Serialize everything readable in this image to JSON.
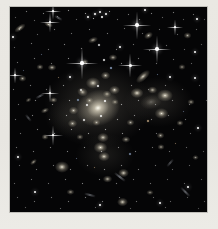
{
  "meta": {
    "description": "Deep-space telescope photograph of a dense galaxy cluster: dozens of fuzzy yellow-white elliptical galaxies concentrated around a large bright central galaxy, foreground stars with cross-shaped diffraction spikes, and many faint points and lensed streaks on a black sky, framed by a pale warm-gray border."
  },
  "frame": {
    "background": "#e9e7e2",
    "photo": {
      "left": 10,
      "top": 7,
      "width": 197,
      "height": 205,
      "background": "#050506"
    }
  },
  "palette": {
    "glow": "185,178,160",
    "galaxy_core": "255,253,242",
    "galaxy_inner": "232,224,202",
    "galaxy_halo": "182,174,154",
    "star": "#ffffff",
    "dot_colors": [
      "255,255,255",
      "168,194,232",
      "255,216,168"
    ],
    "streak": "200,205,215"
  },
  "glows": [
    [
      88,
      98,
      150,
      118,
      0.22
    ],
    [
      148,
      95,
      95,
      70,
      0.15
    ],
    [
      95,
      148,
      82,
      60,
      0.12
    ],
    [
      60,
      110,
      70,
      55,
      0.1
    ]
  ],
  "galaxies": [
    [
      88,
      101,
      62,
      50,
      -18,
      1.0
    ],
    [
      83,
      76,
      20,
      16,
      0,
      0.9
    ],
    [
      72,
      85,
      15,
      12,
      20,
      0.8
    ],
    [
      95,
      68,
      13,
      11,
      0,
      0.8
    ],
    [
      104,
      83,
      15,
      12,
      0,
      0.85
    ],
    [
      63,
      103,
      13,
      11,
      0,
      0.8
    ],
    [
      62,
      116,
      13,
      11,
      0,
      0.75
    ],
    [
      93,
      130,
      16,
      13,
      0,
      0.85
    ],
    [
      127,
      86,
      18,
      14,
      0,
      0.95
    ],
    [
      142,
      83,
      13,
      10,
      0,
      0.8
    ],
    [
      133,
      69,
      24,
      11,
      -42,
      0.9
    ],
    [
      155,
      88,
      22,
      17,
      0,
      0.95
    ],
    [
      151,
      106,
      19,
      15,
      0,
      0.9
    ],
    [
      141,
      95,
      30,
      20,
      -10,
      0.35
    ],
    [
      90,
      140,
      19,
      15,
      0,
      0.95
    ],
    [
      94,
      149,
      16,
      13,
      0,
      0.9
    ],
    [
      113,
      166,
      15,
      12,
      0,
      0.9
    ],
    [
      97,
      172,
      13,
      10,
      0,
      0.8
    ],
    [
      112,
      195,
      15,
      12,
      0,
      0.9
    ],
    [
      52,
      160,
      20,
      16,
      0,
      0.95
    ],
    [
      10,
      21,
      18,
      8,
      -35,
      0.85
    ],
    [
      38,
      17,
      13,
      7,
      25,
      0.8
    ],
    [
      138,
      28,
      13,
      9,
      -30,
      0.8
    ],
    [
      177,
      28,
      11,
      9,
      0,
      0.7
    ],
    [
      23,
      155,
      11,
      6,
      -40,
      0.75
    ],
    [
      150,
      128,
      11,
      9,
      0,
      0.7
    ],
    [
      181,
      95,
      10,
      8,
      0,
      0.7
    ],
    [
      30,
      60,
      10,
      8,
      0,
      0.7
    ],
    [
      42,
      60,
      12,
      9,
      0,
      0.8
    ],
    [
      103,
      50,
      12,
      9,
      0,
      0.75
    ],
    [
      43,
      93,
      11,
      8,
      0,
      0.75
    ],
    [
      12,
      71,
      11,
      9,
      0,
      0.7
    ],
    [
      172,
      60,
      10,
      8,
      0,
      0.65
    ],
    [
      60,
      185,
      11,
      8,
      0,
      0.7
    ],
    [
      140,
      185,
      10,
      7,
      0,
      0.65
    ],
    [
      35,
      130,
      10,
      8,
      0,
      0.7
    ],
    [
      185,
      150,
      9,
      7,
      0,
      0.6
    ],
    [
      120,
      115,
      11,
      9,
      0,
      0.7
    ],
    [
      75,
      55,
      10,
      8,
      0,
      0.7
    ],
    [
      83,
      33,
      14,
      8,
      -20,
      0.75
    ],
    [
      35,
      103,
      12,
      7,
      -25,
      0.7
    ],
    [
      18,
      93,
      9,
      6,
      -30,
      0.6
    ],
    [
      116,
      132,
      12,
      9,
      0,
      0.7
    ],
    [
      151,
      140,
      10,
      8,
      0,
      0.7
    ],
    [
      170,
      116,
      10,
      8,
      0,
      0.7
    ],
    [
      97,
      87,
      12,
      10,
      0,
      0.75
    ],
    [
      79,
      93,
      11,
      9,
      0,
      0.7
    ],
    [
      105,
      95,
      10,
      8,
      0,
      0.7
    ],
    [
      86,
      115,
      11,
      9,
      0,
      0.7
    ],
    [
      70,
      130,
      10,
      8,
      0,
      0.65
    ]
  ],
  "stars": [
    [
      72,
      56,
      1.6,
      16
    ],
    [
      120,
      58,
      1.5,
      12
    ],
    [
      40,
      15,
      1.4,
      10
    ],
    [
      127,
      18,
      1.8,
      14
    ],
    [
      147,
      42,
      1.8,
      14
    ],
    [
      165,
      20,
      1.3,
      8
    ],
    [
      43,
      4,
      1.2,
      8
    ],
    [
      5,
      68,
      1.3,
      8
    ],
    [
      40,
      86,
      1.3,
      9
    ],
    [
      43,
      128,
      1.4,
      10
    ],
    [
      78,
      10,
      1.2,
      0
    ],
    [
      90,
      5,
      1.3,
      0
    ],
    [
      96,
      7,
      1.2,
      0
    ],
    [
      85,
      7,
      1.0,
      0
    ],
    [
      135,
      3,
      1.2,
      0
    ],
    [
      187,
      12,
      1.2,
      0
    ],
    [
      3,
      30,
      1.2,
      0
    ],
    [
      185,
      71,
      1.3,
      0
    ],
    [
      188,
      121,
      1.2,
      0
    ],
    [
      25,
      185,
      1.3,
      0
    ],
    [
      90,
      198,
      1.2,
      0
    ],
    [
      150,
      196,
      1.2,
      0
    ],
    [
      178,
      180,
      1.3,
      0
    ],
    [
      8,
      150,
      1.2,
      0
    ],
    [
      60,
      70,
      1.2,
      0
    ],
    [
      110,
      40,
      1.3,
      0
    ],
    [
      160,
      70,
      1.3,
      0
    ],
    [
      185,
      45,
      1.2,
      0
    ]
  ],
  "dots": [
    [
      5,
      10,
      1,
      0.4
    ],
    [
      16,
      4,
      1,
      0.55
    ],
    [
      24,
      13,
      1,
      0.45
    ],
    [
      33,
      6,
      1,
      0.6
    ],
    [
      47,
      9,
      1,
      0.5
    ],
    [
      58,
      3,
      1,
      0.65
    ],
    [
      66,
      12,
      1,
      0.45
    ],
    [
      75,
      6,
      1,
      0.7
    ],
    [
      83,
      11,
      1,
      0.8
    ],
    [
      91,
      9,
      1.5,
      0.9
    ],
    [
      99,
      4,
      1,
      0.7
    ],
    [
      107,
      12,
      1,
      0.5
    ],
    [
      118,
      7,
      1,
      0.55
    ],
    [
      129,
      12,
      1,
      0.5
    ],
    [
      141,
      6,
      1,
      0.6
    ],
    [
      152,
      10,
      1,
      0.45
    ],
    [
      163,
      5,
      1,
      0.55
    ],
    [
      173,
      12,
      1,
      0.4
    ],
    [
      183,
      7,
      1,
      0.5
    ],
    [
      194,
      12,
      1,
      0.4
    ],
    [
      9,
      22,
      1,
      0.5
    ],
    [
      27,
      27,
      1,
      0.45
    ],
    [
      44,
      22,
      1,
      0.55
    ],
    [
      61,
      26,
      1,
      0.5
    ],
    [
      79,
      22,
      1,
      0.6
    ],
    [
      97,
      26,
      1,
      0.55
    ],
    [
      114,
      21,
      1,
      0.5
    ],
    [
      132,
      26,
      1,
      0.45
    ],
    [
      149,
      22,
      1,
      0.5
    ],
    [
      167,
      27,
      1,
      0.45
    ],
    [
      186,
      22,
      1,
      0.45
    ],
    [
      4,
      40,
      1,
      0.45
    ],
    [
      21,
      36,
      1,
      0.55
    ],
    [
      38,
      42,
      1,
      0.5
    ],
    [
      54,
      37,
      1,
      0.6
    ],
    [
      71,
      41,
      1,
      0.55
    ],
    [
      88,
      37,
      1.5,
      0.75
    ],
    [
      106,
      42,
      1,
      0.6
    ],
    [
      123,
      37,
      1,
      0.5
    ],
    [
      139,
      43,
      1,
      0.55
    ],
    [
      156,
      38,
      1,
      0.5
    ],
    [
      174,
      42,
      1,
      0.45
    ],
    [
      191,
      37,
      1,
      0.4
    ],
    [
      7,
      55,
      1,
      0.5
    ],
    [
      24,
      51,
      1,
      0.55
    ],
    [
      41,
      56,
      1,
      0.5
    ],
    [
      58,
      51,
      1,
      0.65
    ],
    [
      76,
      56,
      1,
      0.6
    ],
    [
      93,
      52,
      1.5,
      0.8
    ],
    [
      111,
      56,
      1,
      0.6
    ],
    [
      128,
      51,
      1,
      0.55
    ],
    [
      146,
      56,
      1,
      0.5
    ],
    [
      163,
      52,
      1,
      0.5
    ],
    [
      181,
      56,
      1,
      0.45
    ],
    [
      31,
      47,
      1,
      0.5,
      1
    ],
    [
      100,
      60,
      1.5,
      0.7,
      1
    ],
    [
      147,
      67,
      1,
      0.55,
      1
    ],
    [
      13,
      63,
      1,
      0.45,
      1
    ],
    [
      48,
      70,
      1,
      0.5,
      2
    ],
    [
      3,
      82,
      1,
      0.5
    ],
    [
      20,
      78,
      1,
      0.55
    ],
    [
      36,
      82,
      1,
      0.5
    ],
    [
      53,
      78,
      1,
      0.65
    ],
    [
      70,
      82,
      1.5,
      0.75
    ],
    [
      87,
      78,
      1.5,
      0.85
    ],
    [
      104,
      82,
      1,
      0.7
    ],
    [
      121,
      78,
      1,
      0.6
    ],
    [
      138,
      82,
      1,
      0.55
    ],
    [
      155,
      78,
      1,
      0.55
    ],
    [
      172,
      82,
      1,
      0.5
    ],
    [
      189,
      78,
      1,
      0.45
    ],
    [
      8,
      97,
      1,
      0.5
    ],
    [
      25,
      93,
      1,
      0.6
    ],
    [
      42,
      97,
      1,
      0.6
    ],
    [
      59,
      93,
      1,
      0.7
    ],
    [
      76,
      97,
      1.5,
      0.85
    ],
    [
      94,
      93,
      1.5,
      0.9
    ],
    [
      111,
      97,
      1,
      0.7
    ],
    [
      128,
      93,
      1,
      0.6
    ],
    [
      145,
      97,
      1,
      0.55
    ],
    [
      162,
      93,
      1,
      0.55
    ],
    [
      179,
      97,
      1,
      0.5
    ],
    [
      196,
      93,
      1,
      0.4
    ],
    [
      67,
      92,
      1.5,
      0.6,
      1
    ],
    [
      173,
      104,
      1,
      0.5,
      1
    ],
    [
      5,
      112,
      1,
      0.5
    ],
    [
      22,
      108,
      1,
      0.6
    ],
    [
      39,
      112,
      1,
      0.6
    ],
    [
      56,
      108,
      1,
      0.7
    ],
    [
      73,
      112,
      1.5,
      0.8
    ],
    [
      90,
      108,
      1.5,
      0.85
    ],
    [
      107,
      112,
      1,
      0.7
    ],
    [
      124,
      108,
      1,
      0.6
    ],
    [
      141,
      112,
      1,
      0.55
    ],
    [
      158,
      108,
      1,
      0.5
    ],
    [
      175,
      112,
      1,
      0.5
    ],
    [
      10,
      126,
      1,
      0.5
    ],
    [
      27,
      122,
      1,
      0.6
    ],
    [
      44,
      126,
      1,
      0.6
    ],
    [
      61,
      122,
      1,
      0.65
    ],
    [
      78,
      126,
      1,
      0.7
    ],
    [
      95,
      122,
      1,
      0.75
    ],
    [
      112,
      126,
      1,
      0.65
    ],
    [
      129,
      122,
      1,
      0.6
    ],
    [
      146,
      126,
      1,
      0.5
    ],
    [
      163,
      122,
      1,
      0.5
    ],
    [
      180,
      126,
      1,
      0.45
    ],
    [
      137,
      113,
      1.5,
      0.6,
      2
    ],
    [
      119,
      146,
      1.5,
      0.6,
      1
    ],
    [
      6,
      140,
      1,
      0.5
    ],
    [
      23,
      144,
      1,
      0.55
    ],
    [
      40,
      140,
      1,
      0.55
    ],
    [
      57,
      144,
      1,
      0.6
    ],
    [
      74,
      140,
      1,
      0.65
    ],
    [
      91,
      144,
      1,
      0.7
    ],
    [
      108,
      140,
      1,
      0.6
    ],
    [
      125,
      144,
      1,
      0.55
    ],
    [
      142,
      140,
      1,
      0.5
    ],
    [
      159,
      144,
      1,
      0.5
    ],
    [
      176,
      140,
      1,
      0.45
    ],
    [
      193,
      144,
      1,
      0.4
    ],
    [
      9,
      158,
      1,
      0.45
    ],
    [
      26,
      162,
      1,
      0.5
    ],
    [
      43,
      158,
      1,
      0.55
    ],
    [
      60,
      162,
      1,
      0.6
    ],
    [
      77,
      158,
      1,
      0.6
    ],
    [
      94,
      162,
      1,
      0.65
    ],
    [
      111,
      158,
      1,
      0.6
    ],
    [
      128,
      162,
      1,
      0.55
    ],
    [
      145,
      158,
      1,
      0.5
    ],
    [
      162,
      162,
      1,
      0.45
    ],
    [
      179,
      158,
      1,
      0.45
    ],
    [
      66,
      151,
      1,
      0.5,
      1
    ],
    [
      84,
      160,
      1,
      0.5,
      2
    ],
    [
      165,
      136,
      1,
      0.5,
      2
    ],
    [
      4,
      176,
      1,
      0.45
    ],
    [
      21,
      172,
      1,
      0.5
    ],
    [
      38,
      176,
      1,
      0.5
    ],
    [
      55,
      172,
      1,
      0.55
    ],
    [
      72,
      176,
      1,
      0.6
    ],
    [
      89,
      172,
      1,
      0.6
    ],
    [
      106,
      176,
      1,
      0.55
    ],
    [
      123,
      172,
      1,
      0.5
    ],
    [
      140,
      176,
      1,
      0.5
    ],
    [
      157,
      172,
      1,
      0.45
    ],
    [
      174,
      176,
      1,
      0.45
    ],
    [
      191,
      172,
      1,
      0.4
    ],
    [
      7,
      190,
      1,
      0.45
    ],
    [
      24,
      194,
      1,
      0.5
    ],
    [
      41,
      190,
      1,
      0.5
    ],
    [
      58,
      194,
      1,
      0.55
    ],
    [
      75,
      190,
      1,
      0.55
    ],
    [
      92,
      194,
      1,
      0.55
    ],
    [
      109,
      190,
      1,
      0.5
    ],
    [
      126,
      194,
      1,
      0.5
    ],
    [
      143,
      190,
      1,
      0.45
    ],
    [
      160,
      194,
      1,
      0.45
    ],
    [
      177,
      190,
      1,
      0.4
    ],
    [
      194,
      194,
      1,
      0.4
    ],
    [
      15,
      200,
      1,
      0.4
    ],
    [
      50,
      201,
      1,
      0.45
    ],
    [
      85,
      200,
      1,
      0.45
    ],
    [
      120,
      201,
      1,
      0.4
    ],
    [
      155,
      200,
      1,
      0.4
    ],
    [
      188,
      201,
      1,
      0.35
    ]
  ],
  "streaks": [
    [
      110,
      169,
      14,
      38,
      0.5
    ],
    [
      175,
      184,
      13,
      45,
      0.45
    ],
    [
      30,
      88,
      10,
      -28,
      0.4
    ],
    [
      80,
      187,
      12,
      15,
      0.4
    ],
    [
      48,
      10,
      9,
      30,
      0.4
    ],
    [
      160,
      155,
      10,
      -50,
      0.35
    ],
    [
      18,
      110,
      9,
      50,
      0.35
    ]
  ]
}
